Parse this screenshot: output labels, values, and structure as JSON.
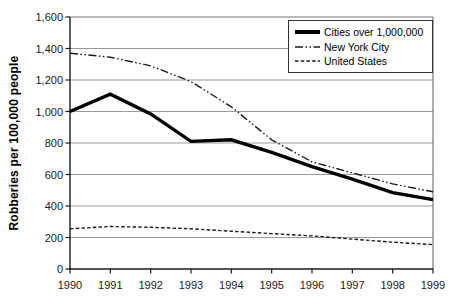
{
  "chart_data": {
    "type": "line",
    "title": "",
    "xlabel": "",
    "ylabel": "Robberies per 100,000 people",
    "categories": [
      "1990",
      "1991",
      "1992",
      "1993",
      "1994",
      "1995",
      "1996",
      "1997",
      "1998",
      "1999"
    ],
    "y_tick_labels": [
      "0",
      "200",
      "400",
      "600",
      "800",
      "1,000",
      "1,200",
      "1,400",
      "1,600"
    ],
    "ylim": [
      0,
      1600
    ],
    "grid": "horizontal-only",
    "legend_position": "top-right",
    "series": [
      {
        "name": "Cities over 1,000,000",
        "line_style": "solid",
        "stroke_width": 3.4,
        "color": "#000000",
        "values": [
          1000,
          1110,
          985,
          810,
          820,
          740,
          650,
          570,
          485,
          440
        ]
      },
      {
        "name": "New York City",
        "line_style": "dash-dot-dot",
        "stroke_width": 1.4,
        "color": "#1a1a1a",
        "values": [
          1370,
          1345,
          1290,
          1190,
          1030,
          820,
          680,
          610,
          540,
          490
        ]
      },
      {
        "name": "United States",
        "line_style": "dashed",
        "stroke_width": 1.4,
        "color": "#1a1a1a",
        "values": [
          255,
          270,
          265,
          255,
          240,
          225,
          210,
          190,
          170,
          155
        ]
      }
    ]
  },
  "colors": {
    "background": "#ffffff",
    "axis": "#1a1a1a",
    "grid": "#9b9b9b",
    "plot_border": "#777777",
    "legend_border": "#333333",
    "text": "#1a1a1a"
  }
}
